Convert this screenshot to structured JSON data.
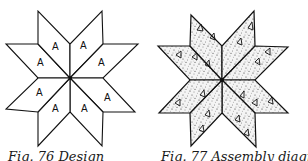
{
  "figures": [
    {
      "id": "fig-76",
      "caption": "Fig. 76 Design",
      "type": "eight-pointed-star-design",
      "piece_label": "A",
      "piece_count": 8,
      "fill": "#ffffff",
      "stroke": "#111111"
    },
    {
      "id": "fig-77",
      "caption": "Fig. 77 Assembly diagram",
      "type": "eight-pointed-star-assembly",
      "piece_count": 8,
      "fill_pattern": "speckled-print-with-triangles",
      "stroke": "#111111"
    }
  ]
}
